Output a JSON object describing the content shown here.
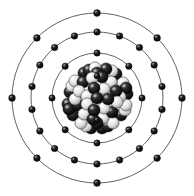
{
  "figure": {
    "element_symbol": "Kr",
    "element_name": "Krypton",
    "atomic_number": 36,
    "mass_number": 84,
    "background_color": "#ffffff",
    "orbit_line_color": "#3a3a3a",
    "electron_color": "#121212",
    "proton_color": "#111111",
    "neutron_color": "#f2f2f2",
    "center": {
      "x": 97,
      "y": 98
    }
  },
  "nucleus": {
    "label": "nucleus",
    "proton_count": 36,
    "neutron_count": 48,
    "cluster_radius": 36,
    "nucleon_radius": 6.1,
    "nucleons": [
      {
        "t": "p",
        "x": -27,
        "y": -6,
        "z": 1
      },
      {
        "t": "n",
        "x": -22,
        "y": -17,
        "z": 2
      },
      {
        "t": "p",
        "x": -13,
        "y": -25,
        "z": 1
      },
      {
        "t": "n",
        "x": -2,
        "y": -30,
        "z": 3
      },
      {
        "t": "p",
        "x": 9,
        "y": -29,
        "z": 2
      },
      {
        "t": "p",
        "x": 19,
        "y": -24,
        "z": 1
      },
      {
        "t": "n",
        "x": 26,
        "y": -15,
        "z": 2
      },
      {
        "t": "p",
        "x": 30,
        "y": -4,
        "z": 1
      },
      {
        "t": "n",
        "x": 29,
        "y": 7,
        "z": 2
      },
      {
        "t": "p",
        "x": 24,
        "y": 17,
        "z": 1
      },
      {
        "t": "n",
        "x": 16,
        "y": 25,
        "z": 3
      },
      {
        "t": "p",
        "x": 5,
        "y": 30,
        "z": 2
      },
      {
        "t": "p",
        "x": -6,
        "y": 30,
        "z": 1
      },
      {
        "t": "n",
        "x": -16,
        "y": 25,
        "z": 2
      },
      {
        "t": "p",
        "x": -24,
        "y": 17,
        "z": 1
      },
      {
        "t": "p",
        "x": -29,
        "y": 6,
        "z": 2
      },
      {
        "t": "n",
        "x": -18,
        "y": -7,
        "z": 4
      },
      {
        "t": "p",
        "x": -14,
        "y": -16,
        "z": 3
      },
      {
        "t": "n",
        "x": -5,
        "y": -20,
        "z": 5
      },
      {
        "t": "p",
        "x": 5,
        "y": -21,
        "z": 4
      },
      {
        "t": "n",
        "x": 14,
        "y": -16,
        "z": 3
      },
      {
        "t": "p",
        "x": 19,
        "y": -7,
        "z": 4
      },
      {
        "t": "n",
        "x": 20,
        "y": 4,
        "z": 5
      },
      {
        "t": "p",
        "x": 15,
        "y": 14,
        "z": 4
      },
      {
        "t": "n",
        "x": 6,
        "y": 20,
        "z": 3
      },
      {
        "t": "p",
        "x": -4,
        "y": 21,
        "z": 5
      },
      {
        "t": "n",
        "x": -13,
        "y": 16,
        "z": 4
      },
      {
        "t": "p",
        "x": -19,
        "y": 7,
        "z": 3
      },
      {
        "t": "n",
        "x": -10,
        "y": -2,
        "z": 6
      },
      {
        "t": "p",
        "x": -3,
        "y": -10,
        "z": 7
      },
      {
        "t": "n",
        "x": 7,
        "y": -9,
        "z": 6
      },
      {
        "t": "p",
        "x": 11,
        "y": 1,
        "z": 7
      },
      {
        "t": "n",
        "x": 7,
        "y": 10,
        "z": 6
      },
      {
        "t": "p",
        "x": -3,
        "y": 12,
        "z": 7
      },
      {
        "t": "n",
        "x": -10,
        "y": 6,
        "z": 6
      },
      {
        "t": "p",
        "x": 0,
        "y": 0,
        "z": 8
      },
      {
        "t": "n",
        "x": -25,
        "y": -12,
        "z": 1
      },
      {
        "t": "p",
        "x": -8,
        "y": -28,
        "z": 2
      },
      {
        "t": "n",
        "x": 15,
        "y": -27,
        "z": 1
      },
      {
        "t": "p",
        "x": 29,
        "y": -10,
        "z": 2
      },
      {
        "t": "n",
        "x": 28,
        "y": 12,
        "z": 1
      },
      {
        "t": "p",
        "x": 11,
        "y": 28,
        "z": 2
      },
      {
        "t": "n",
        "x": -11,
        "y": 28,
        "z": 1
      },
      {
        "t": "p",
        "x": -28,
        "y": 11,
        "z": 2
      },
      {
        "t": "n",
        "x": -22,
        "y": 1,
        "z": 3
      },
      {
        "t": "p",
        "x": 0,
        "y": -25,
        "z": 3
      },
      {
        "t": "n",
        "x": 23,
        "y": -1,
        "z": 3
      },
      {
        "t": "p",
        "x": 0,
        "y": 25,
        "z": 3
      }
    ]
  },
  "shells": [
    {
      "index": 1,
      "name": "K shell",
      "radius": 22,
      "electron_count": 2,
      "start_angle": -90,
      "electron_radius": 3.0
    },
    {
      "index": 2,
      "name": "L shell",
      "radius": 45,
      "electron_count": 8,
      "start_angle": -90,
      "electron_radius": 3.2
    },
    {
      "index": 3,
      "name": "M shell",
      "radius": 66,
      "electron_count": 18,
      "start_angle": -90,
      "electron_radius": 3.3
    },
    {
      "index": 4,
      "name": "N shell",
      "radius": 85,
      "electron_count": 8,
      "start_angle": -90,
      "electron_radius": 3.4
    }
  ],
  "electron_configuration": "2, 8, 18, 8"
}
